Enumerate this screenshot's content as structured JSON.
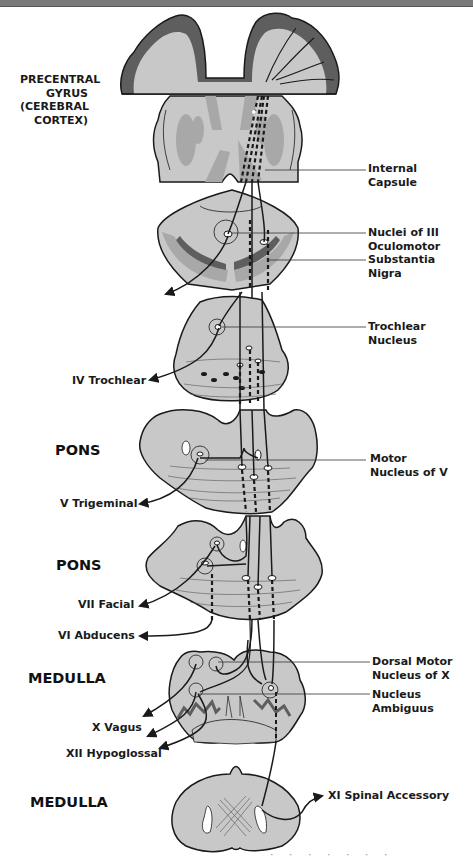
{
  "diagram": {
    "colors": {
      "tissue_light": "#c8c8c8",
      "tissue_mid": "#a8a8a8",
      "tissue_dark": "#5e5e5e",
      "outline": "#1a1a1a",
      "background": "#ffffff"
    },
    "left_labels": {
      "cortex": [
        "PRECENTRAL",
        "GYRUS",
        "(CEREBRAL",
        "CORTEX)"
      ],
      "pons_1": "PONS",
      "pons_2": "PONS",
      "medulla_1": "MEDULLA",
      "medulla_2": "MEDULLA"
    },
    "nerve_labels": {
      "iv": "IV Trochlear",
      "v": "V Trigeminal",
      "vii": "VII Facial",
      "vi": "VI Abducens",
      "x": "X Vagus",
      "xii": "XII Hypoglossal",
      "xi": "XI Spinal Accessory"
    },
    "right_labels": {
      "internal_capsule": [
        "Internal",
        "Capsule"
      ],
      "nuclei_iii": [
        "Nuclei of III",
        "Oculomotor"
      ],
      "substantia_nigra": [
        "Substantia",
        "Nigra"
      ],
      "trochlear_nucleus": [
        "Trochlear",
        "Nucleus"
      ],
      "motor_nucleus_v": [
        "Motor",
        "Nucleus of V"
      ],
      "dorsal_motor_x": [
        "Dorsal Motor",
        "Nucleus of X"
      ],
      "nucleus_ambiguus": [
        "Nucleus",
        "Ambiguus"
      ]
    },
    "caption_fragment": "· · · · · · ·"
  }
}
